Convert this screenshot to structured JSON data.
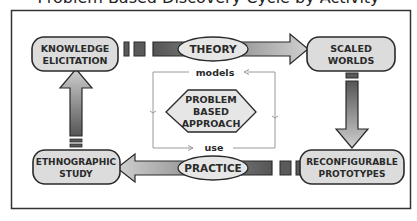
{
  "title": "Problem Based Discovery Cycle by Activity",
  "nodes": {
    "knowledge_elicitation": [
      "KNOWLEDGE",
      "ELICITATION"
    ],
    "scaled_worlds": [
      "SCALED",
      "WORLDS"
    ],
    "reconfigurable_prototypes": [
      "RECONFIGURABLE",
      "PROTOTYPES"
    ],
    "ethnographic_study": [
      "ETHNOGRAPHIC",
      "STUDY"
    ]
  },
  "edges": {
    "top": "THEORY",
    "bottom": "PRACTICE"
  },
  "center": {
    "lines": [
      "PROBLEM",
      "BASED",
      "APPROACH"
    ],
    "top_loop_label": "models",
    "bottom_loop_label": "use"
  },
  "colors": {
    "node_fill": "#dcdcdc",
    "stroke": "#2a2a2a",
    "arrow_dark": "#5a5a5a",
    "arrow_light": "#c8c8c8",
    "loop_line": "#9a9a9a"
  }
}
